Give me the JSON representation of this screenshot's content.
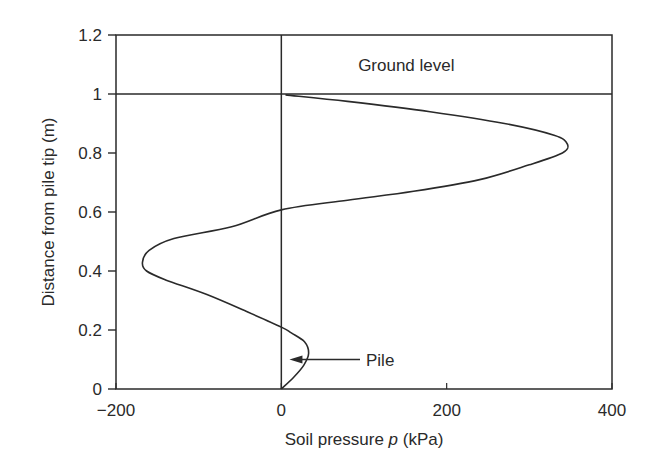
{
  "chart_data": {
    "type": "line",
    "title": "",
    "xlabel": "Soil pressure p (kPa)",
    "xlabel_parts": {
      "pre": "Soil pressure ",
      "italic": "p",
      "post": " (kPa)"
    },
    "ylabel": "Distance from pile tip (m)",
    "xlim": [
      -200,
      400
    ],
    "ylim": [
      0,
      1.2
    ],
    "xticks": [
      -200,
      0,
      200,
      400
    ],
    "xtick_labels": [
      "−200",
      "0",
      "200",
      "400"
    ],
    "yticks": [
      0,
      0.2,
      0.4,
      0.6,
      0.8,
      1,
      1.2
    ],
    "ytick_labels": [
      "0",
      "0.2",
      "0.4",
      "0.6",
      "0.8",
      "1",
      "1.2"
    ],
    "grid": false,
    "legend": null,
    "reference_lines": [
      {
        "orientation": "vertical",
        "x": 0,
        "label": "pile axis"
      },
      {
        "orientation": "horizontal",
        "y": 1.0,
        "label": "Ground level"
      }
    ],
    "annotations": [
      {
        "text": "Ground level",
        "x": 150,
        "y": 1.1
      },
      {
        "text": "Pile",
        "x": 100,
        "y": 0.11,
        "arrow_to": {
          "x": 5,
          "y": 0.11
        }
      }
    ],
    "series": [
      {
        "name": "Soil pressure distribution",
        "points": [
          {
            "p": 0,
            "z": 0.0
          },
          {
            "p": 15,
            "z": 0.04
          },
          {
            "p": 27,
            "z": 0.08
          },
          {
            "p": 33,
            "z": 0.12
          },
          {
            "p": 28,
            "z": 0.16
          },
          {
            "p": 12,
            "z": 0.19
          },
          {
            "p": 0,
            "z": 0.21
          },
          {
            "p": -40,
            "z": 0.26
          },
          {
            "p": -90,
            "z": 0.32
          },
          {
            "p": -140,
            "z": 0.37
          },
          {
            "p": -163,
            "z": 0.4
          },
          {
            "p": -168,
            "z": 0.43
          },
          {
            "p": -160,
            "z": 0.47
          },
          {
            "p": -130,
            "z": 0.51
          },
          {
            "p": -60,
            "z": 0.55
          },
          {
            "p": 0,
            "z": 0.607
          },
          {
            "p": 80,
            "z": 0.64
          },
          {
            "p": 160,
            "z": 0.67
          },
          {
            "p": 240,
            "z": 0.71
          },
          {
            "p": 300,
            "z": 0.76
          },
          {
            "p": 340,
            "z": 0.8
          },
          {
            "p": 346,
            "z": 0.83
          },
          {
            "p": 330,
            "z": 0.86
          },
          {
            "p": 270,
            "z": 0.9
          },
          {
            "p": 180,
            "z": 0.94
          },
          {
            "p": 80,
            "z": 0.975
          },
          {
            "p": 5,
            "z": 0.997
          }
        ]
      }
    ]
  }
}
